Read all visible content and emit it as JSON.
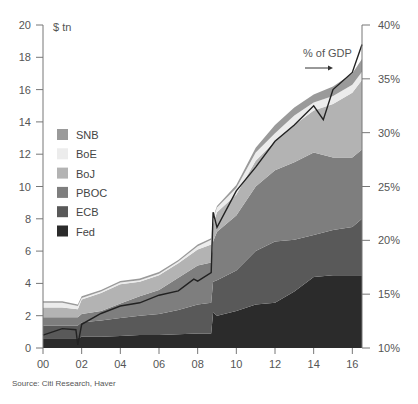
{
  "chart_data": {
    "type": "area",
    "title": "",
    "ylabel_left": "$ tn",
    "ylabel_right": "% of GDP",
    "annotation": "% of GDP",
    "x_ticks": [
      "00",
      "02",
      "04",
      "06",
      "08",
      "10",
      "12",
      "14",
      "16"
    ],
    "y_left_ticks": [
      0,
      2,
      4,
      6,
      8,
      10,
      12,
      14,
      16,
      18,
      20
    ],
    "y_right_ticks": [
      "10%",
      "15%",
      "20%",
      "25%",
      "30%",
      "35%",
      "40%"
    ],
    "ylim_left": [
      0,
      20
    ],
    "ylim_right": [
      10,
      40
    ],
    "xlim": [
      2000,
      2016.5
    ],
    "stacked": true,
    "legend": [
      "SNB",
      "BoE",
      "BoJ",
      "PBOC",
      "ECB",
      "Fed"
    ],
    "x": [
      2000,
      2001,
      2001.8,
      2002,
      2003,
      2004,
      2005,
      2006,
      2007,
      2008,
      2008.7,
      2008.8,
      2009,
      2010,
      2011,
      2012,
      2013,
      2014,
      2015,
      2016,
      2016.5
    ],
    "series": [
      {
        "name": "Fed",
        "color": "#2b2b2b",
        "values": [
          0.6,
          0.6,
          0.6,
          0.7,
          0.7,
          0.75,
          0.8,
          0.8,
          0.85,
          0.9,
          0.9,
          2.2,
          2.0,
          2.3,
          2.7,
          2.8,
          3.5,
          4.4,
          4.5,
          4.5,
          4.5
        ]
      },
      {
        "name": "ECB",
        "color": "#595959",
        "values": [
          0.8,
          0.8,
          0.8,
          0.9,
          1.0,
          1.1,
          1.2,
          1.3,
          1.5,
          1.8,
          1.9,
          1.9,
          2.2,
          2.5,
          3.3,
          3.8,
          3.2,
          2.6,
          2.8,
          3.0,
          3.5
        ]
      },
      {
        "name": "PBOC",
        "color": "#7e7e7e",
        "values": [
          0.5,
          0.5,
          0.5,
          0.5,
          0.6,
          0.9,
          1.2,
          1.5,
          2.0,
          2.4,
          2.5,
          2.5,
          3.0,
          3.4,
          4.0,
          4.4,
          4.8,
          5.1,
          4.5,
          4.3,
          4.3
        ]
      },
      {
        "name": "BoJ",
        "color": "#b3b3b3",
        "values": [
          0.6,
          0.6,
          0.5,
          0.9,
          1.1,
          1.2,
          0.9,
          0.9,
          0.9,
          1.0,
          1.1,
          1.1,
          1.2,
          1.3,
          1.6,
          1.8,
          2.3,
          2.6,
          3.3,
          4.0,
          4.3
        ]
      },
      {
        "name": "BoE",
        "color": "#ececec",
        "values": [
          0.3,
          0.3,
          0.2,
          0.1,
          0.1,
          0.1,
          0.1,
          0.1,
          0.1,
          0.2,
          0.3,
          0.3,
          0.3,
          0.4,
          0.5,
          0.5,
          0.6,
          0.5,
          0.5,
          0.5,
          0.5
        ]
      },
      {
        "name": "SNB",
        "color": "#9a9a9a",
        "values": [
          0.1,
          0.1,
          0.1,
          0.1,
          0.1,
          0.1,
          0.1,
          0.1,
          0.1,
          0.1,
          0.1,
          0.1,
          0.1,
          0.2,
          0.3,
          0.5,
          0.5,
          0.5,
          0.6,
          0.7,
          0.8
        ]
      }
    ],
    "line": {
      "name": "% of GDP",
      "axis": "right",
      "x": [
        2000,
        2001,
        2001.7,
        2001.8,
        2002,
        2003,
        2004,
        2005,
        2006,
        2007,
        2007.8,
        2008,
        2008.7,
        2008.8,
        2009,
        2010,
        2011,
        2012,
        2013,
        2014,
        2014.5,
        2015,
        2016,
        2016.5
      ],
      "values": [
        11.2,
        11.8,
        11.7,
        10.3,
        12.2,
        13.2,
        13.9,
        14.2,
        14.9,
        15.3,
        16.4,
        16.2,
        17.0,
        22.6,
        21.2,
        24.6,
        26.8,
        29.2,
        30.7,
        32.5,
        31.2,
        34.0,
        35.6,
        38.2
      ]
    }
  },
  "legend": {
    "items": [
      {
        "label": "SNB",
        "color": "#9a9a9a"
      },
      {
        "label": "BoE",
        "color": "#ececec"
      },
      {
        "label": "BoJ",
        "color": "#b3b3b3"
      },
      {
        "label": "PBOC",
        "color": "#7e7e7e"
      },
      {
        "label": "ECB",
        "color": "#595959"
      },
      {
        "label": "Fed",
        "color": "#2b2b2b"
      }
    ]
  },
  "labels": {
    "unit": "$ tn",
    "gdp": "% of GDP",
    "source": "Source: Citi Research, Haver"
  }
}
